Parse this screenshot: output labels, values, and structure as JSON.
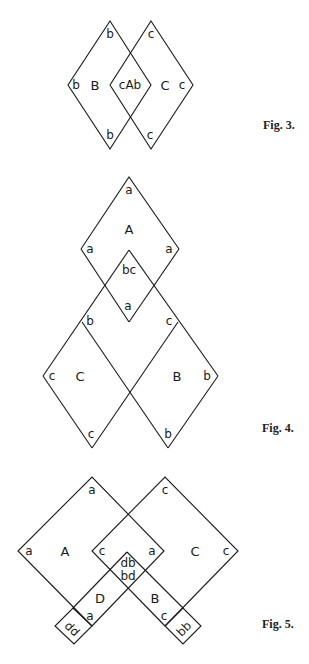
{
  "figures": [
    {
      "caption": "Fig. 3.",
      "labels": {
        "left_top": "b",
        "left_left": "b",
        "left_bottom": "b",
        "left_region": "B",
        "center": "cAb",
        "right_top": "c",
        "right_right": "c",
        "right_bottom": "c",
        "right_region": "C"
      }
    },
    {
      "caption": "Fig. 4.",
      "labels": {
        "A_top": "a",
        "A_left": "a",
        "A_right": "a",
        "A_region": "A",
        "inner_top": "bc",
        "inner_bottom": "a",
        "C_top": "b",
        "C_left": "c",
        "C_region": "C",
        "C_bottom": "c",
        "B_top": "c",
        "B_right": "b",
        "B_region": "B",
        "B_bottom": "b"
      }
    },
    {
      "caption": "Fig. 5.",
      "labels": {
        "A_top": "a",
        "A_left": "a",
        "A_region": "A",
        "A_right": "a",
        "C_top": "c",
        "C_left": "c",
        "C_region": "C",
        "C_right": "c",
        "center_upper": "db",
        "center_lower": "bd",
        "D_region": "D",
        "D_end": "a",
        "dd_square": "dd",
        "B_region": "B",
        "B_end": "c",
        "bb_square": "bb"
      }
    }
  ]
}
